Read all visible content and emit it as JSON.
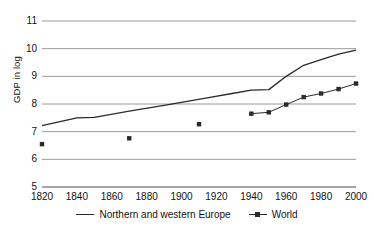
{
  "chart_data": {
    "type": "line",
    "title": "",
    "xlabel": "",
    "ylabel": "GDP in log",
    "xlim": [
      1820,
      2000
    ],
    "ylim": [
      5,
      11
    ],
    "grid": true,
    "legend_position": "bottom",
    "xticks": [
      "1820",
      "1840",
      "1860",
      "1880",
      "1900",
      "1920",
      "1940",
      "1960",
      "1980",
      "2000"
    ],
    "yticks": [
      "5",
      "6",
      "7",
      "8",
      "9",
      "10",
      "11"
    ],
    "series": [
      {
        "name": "Northern and western Europe",
        "style": "line",
        "x": [
          1820,
          1840,
          1850,
          1870,
          1890,
          1913,
          1929,
          1940,
          1950,
          1960,
          1970,
          1980,
          1990,
          2000
        ],
        "values": [
          7.22,
          7.5,
          7.52,
          7.74,
          7.95,
          8.2,
          8.38,
          8.5,
          8.52,
          9.0,
          9.4,
          9.6,
          9.8,
          9.95
        ]
      },
      {
        "name": "World",
        "style": "marker-line",
        "x": [
          1820,
          1870,
          1910,
          1940,
          1950,
          1960,
          1970,
          1980,
          1990,
          2000
        ],
        "values": [
          6.55,
          6.76,
          7.27,
          7.65,
          7.7,
          7.98,
          8.25,
          8.38,
          8.54,
          8.74
        ],
        "connected_from": 1940
      }
    ]
  },
  "legend": {
    "europe_label": "Northern and western Europe",
    "world_label": "World"
  },
  "colors": {
    "line": "#2a2a2a",
    "grid": "#808080",
    "axis": "#4a4a4a",
    "text": "#111111",
    "background": "#ffffff"
  }
}
